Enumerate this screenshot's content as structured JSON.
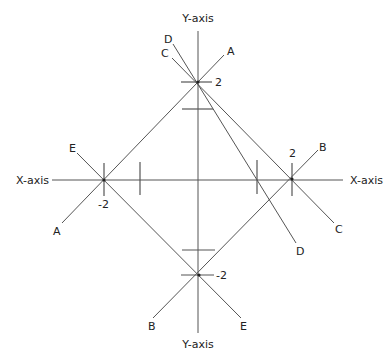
{
  "diagram": {
    "axes": {
      "x_label_left": "X-axis",
      "x_label_right": "X-axis",
      "y_label_top": "Y-axis",
      "y_label_bottom": "Y-axis"
    },
    "tick_labels": {
      "top": "2",
      "right": "2",
      "left": "-2",
      "bottom": "-2"
    },
    "lines": [
      {
        "name": "A",
        "label_start": "A",
        "label_end": "A"
      },
      {
        "name": "B",
        "label_start": "B",
        "label_end": "B"
      },
      {
        "name": "C",
        "label_start": "C",
        "label_end": "C"
      },
      {
        "name": "D",
        "label_start": "D",
        "label_end": "D"
      },
      {
        "name": "E",
        "label_start": "E",
        "label_end": "E"
      }
    ],
    "colors": {
      "line": "#555555",
      "text": "#222222",
      "background": "#ffffff"
    }
  }
}
